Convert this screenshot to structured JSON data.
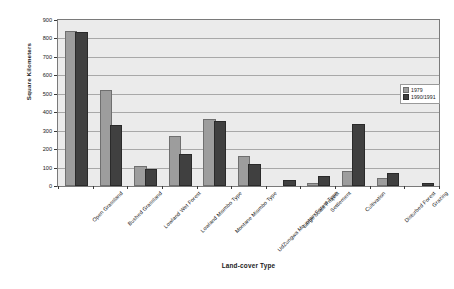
{
  "chart_data": {
    "type": "bar",
    "title": "",
    "xlabel": "Land-cover Type",
    "ylabel": "Square Kilometers",
    "ylim": [
      0,
      900
    ],
    "ytick_step": 100,
    "yticks": [
      0,
      100,
      200,
      300,
      400,
      500,
      600,
      700,
      800,
      900
    ],
    "grid": "horizontal",
    "legend_position": "right",
    "categories": [
      "Open Grassland",
      "Bushed Grassland",
      "Lowland Wet Forest",
      "Lowland Miombo Type",
      "Montane Miombo Type",
      "UdZungwa Mountain Forest Type",
      "Large Scale Project",
      "Settlement",
      "Cultivation",
      "Disturbed Forest",
      "Grazing"
    ],
    "series": [
      {
        "name": "1979",
        "color": "#9d9d9d",
        "values": [
          832,
          512,
          97,
          258,
          355,
          150,
          0,
          8,
          73,
          35,
          0
        ]
      },
      {
        "name": "1990/1991",
        "color": "#404040",
        "values": [
          826,
          318,
          79,
          162,
          343,
          110,
          23,
          41,
          325,
          62,
          7
        ]
      }
    ]
  },
  "legend": {
    "entries": [
      {
        "label": "1979"
      },
      {
        "label": "1990/1991"
      }
    ]
  }
}
